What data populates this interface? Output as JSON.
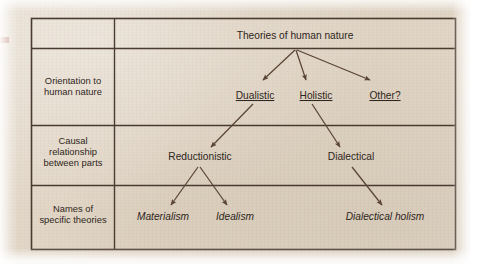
{
  "figure": {
    "kind": "hierarchy-table-diagram",
    "colors": {
      "page_background": "#e2d7c7",
      "border": "#4a3b30",
      "text": "#2e2620",
      "arrow": "#5a4436",
      "margin_mark": "#c08a72"
    },
    "table": {
      "row_labels": [
        "",
        "Orientation to\nhuman nature",
        "Causal\nrelationship\nbetween parts",
        "Names of\nspecific theories"
      ],
      "row_label_lines": [
        [],
        [
          "Orientation to",
          "human nature"
        ],
        [
          "Causal",
          "relationship",
          "between parts"
        ],
        [
          "Names of",
          "specific theories"
        ]
      ]
    },
    "tree": {
      "root": "Theories of human nature",
      "level2": [
        {
          "label": "Dualistic",
          "underlined": true
        },
        {
          "label": "Holistic",
          "underlined": true
        },
        {
          "label": "Other?",
          "underlined": true
        }
      ],
      "level3": [
        {
          "label": "Reductionistic",
          "parent": "Dualistic"
        },
        {
          "label": "Dialectical",
          "parent": "Holistic"
        }
      ],
      "level4": [
        {
          "label": "Materialism",
          "parent": "Reductionistic",
          "italic": true
        },
        {
          "label": "Idealism",
          "parent": "Reductionistic",
          "italic": true
        },
        {
          "label": "Dialectical holism",
          "parent": "Dialectical",
          "italic": true
        }
      ],
      "edges": [
        {
          "from": "Theories of human nature",
          "to": "Dualistic"
        },
        {
          "from": "Theories of human nature",
          "to": "Holistic"
        },
        {
          "from": "Theories of human nature",
          "to": "Other?"
        },
        {
          "from": "Dualistic",
          "to": "Reductionistic"
        },
        {
          "from": "Holistic",
          "to": "Dialectical"
        },
        {
          "from": "Reductionistic",
          "to": "Materialism"
        },
        {
          "from": "Reductionistic",
          "to": "Idealism"
        },
        {
          "from": "Dialectical",
          "to": "Dialectical holism"
        }
      ]
    }
  }
}
